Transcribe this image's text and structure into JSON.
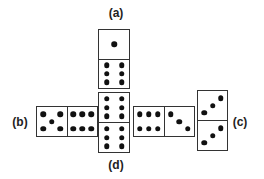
{
  "figure": {
    "labels": {
      "a": "(a)",
      "b": "(b)",
      "c": "(c)",
      "d": "(d)"
    },
    "dominoes": [
      {
        "id": "a",
        "orientation": "vertical",
        "x": 98,
        "y": 29,
        "w": 32,
        "h": 60,
        "halves": [
          1,
          6
        ]
      },
      {
        "id": "d",
        "orientation": "vertical",
        "x": 98,
        "y": 92,
        "w": 32,
        "h": 61,
        "halves": [
          6,
          6
        ]
      },
      {
        "id": "b",
        "orientation": "horizontal",
        "x": 36,
        "y": 106,
        "w": 62,
        "h": 31,
        "halves": [
          5,
          6
        ]
      },
      {
        "id": "right-middle",
        "orientation": "horizontal",
        "x": 133,
        "y": 106,
        "w": 62,
        "h": 31,
        "halves": [
          6,
          3
        ]
      },
      {
        "id": "c",
        "orientation": "vertical",
        "x": 197,
        "y": 90,
        "w": 31,
        "h": 61,
        "halves": [
          3,
          3
        ]
      }
    ],
    "pip_color": "#111111",
    "border_color": "#333333"
  }
}
